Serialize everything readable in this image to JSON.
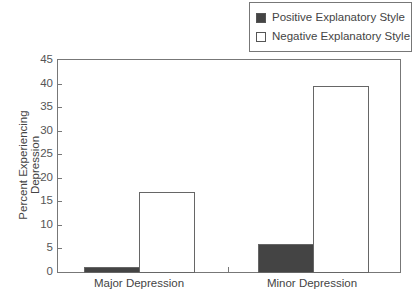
{
  "chart_data": {
    "type": "bar",
    "title": "",
    "xlabel": "",
    "ylabel": "Percent Experiencing Depression",
    "ylim": [
      0,
      45
    ],
    "yticks": [
      0,
      5,
      10,
      15,
      20,
      25,
      30,
      35,
      40,
      45
    ],
    "categories": [
      "Major Depression",
      "Minor Depression"
    ],
    "series": [
      {
        "name": "Positive Explanatory Style",
        "color": "#444444",
        "values": [
          1,
          6
        ]
      },
      {
        "name": "Negative Explanatory Style",
        "color": "#ffffff",
        "values": [
          17,
          39.5
        ]
      }
    ],
    "legend_position": "top-right, outside plot",
    "grid": false
  },
  "legend": {
    "items": [
      {
        "label": "Positive Explanatory Style",
        "color": "#444444"
      },
      {
        "label": "Negative Explanatory Style",
        "color": "#ffffff"
      }
    ]
  },
  "axis": {
    "ylabel": "Percent Experiencing Depression",
    "yticks": [
      "0",
      "5",
      "10",
      "15",
      "20",
      "25",
      "30",
      "35",
      "40",
      "45"
    ],
    "categories": [
      "Major Depression",
      "Minor Depression"
    ]
  }
}
